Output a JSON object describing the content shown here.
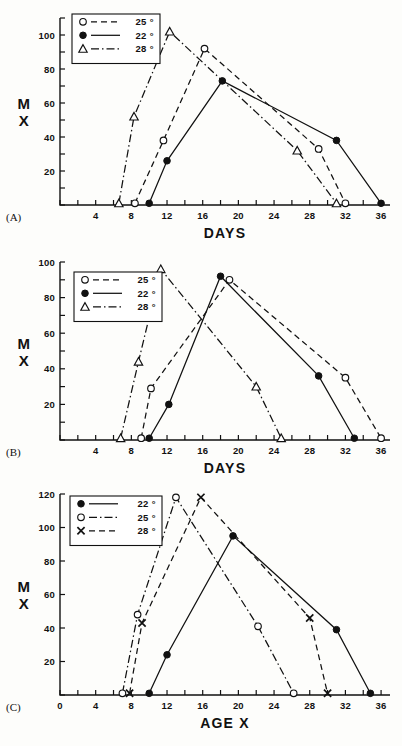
{
  "figure": {
    "label": "Temperature effect on MX versus age",
    "panels": [
      "A",
      "B",
      "C"
    ]
  },
  "chart_data": [
    {
      "type": "line",
      "panel_tag": "(A)",
      "title": "",
      "xlabel": "DAYS",
      "ylabel": "MX",
      "xlim": [
        0,
        37
      ],
      "ylim": [
        0,
        110
      ],
      "xticks": [
        0,
        2,
        4,
        6,
        8,
        10,
        12,
        14,
        16,
        18,
        20,
        22,
        24,
        26,
        28,
        30,
        32,
        34,
        36
      ],
      "xticklabels": [
        "",
        "",
        "4",
        "",
        "8",
        "",
        "12",
        "",
        "16",
        "",
        "20",
        "",
        "24",
        "",
        "28",
        "",
        "32",
        "",
        "36"
      ],
      "yticks": [
        0,
        10,
        20,
        30,
        40,
        50,
        60,
        70,
        80,
        90,
        100,
        110
      ],
      "yticklabels": [
        "",
        "",
        "20",
        "",
        "40",
        "",
        "60",
        "",
        "80",
        "",
        "100",
        ""
      ],
      "grid": false,
      "legend_position": "top-left",
      "series": [
        {
          "name": "25 °",
          "marker": "open-circle",
          "line": "dashed",
          "x": [
            8.4,
            11.6,
            16.2,
            29.0,
            32.0
          ],
          "y": [
            1,
            38,
            92,
            33,
            1
          ]
        },
        {
          "name": "22 °",
          "marker": "filled-circle",
          "line": "solid",
          "x": [
            10.0,
            12.0,
            18.2,
            31.0,
            36.0
          ],
          "y": [
            1,
            26,
            73,
            38,
            1
          ]
        },
        {
          "name": "28 °",
          "marker": "open-triangle",
          "line": "dash-dot",
          "x": [
            6.6,
            8.3,
            12.3,
            26.6,
            31.0
          ],
          "y": [
            1,
            52,
            102,
            32,
            1
          ]
        }
      ]
    },
    {
      "type": "line",
      "panel_tag": "(B)",
      "title": "",
      "xlabel": "DAYS",
      "ylabel": "MX",
      "xlim": [
        0,
        37
      ],
      "ylim": [
        0,
        100
      ],
      "xticks": [
        0,
        2,
        4,
        6,
        8,
        10,
        12,
        14,
        16,
        18,
        20,
        22,
        24,
        26,
        28,
        30,
        32,
        34,
        36
      ],
      "xticklabels": [
        "",
        "",
        "4",
        "",
        "8",
        "",
        "12",
        "",
        "16",
        "",
        "20",
        "",
        "24",
        "",
        "28",
        "",
        "32",
        "",
        "36"
      ],
      "yticks": [
        0,
        10,
        20,
        30,
        40,
        50,
        60,
        70,
        80,
        90,
        100
      ],
      "yticklabels": [
        "",
        "",
        "20",
        "",
        "40",
        "",
        "60",
        "",
        "80",
        "",
        "100"
      ],
      "grid": false,
      "legend_position": "top-left",
      "series": [
        {
          "name": "25 °",
          "marker": "open-circle",
          "line": "dashed",
          "x": [
            9.1,
            10.2,
            19.0,
            32.0,
            36.0
          ],
          "y": [
            1,
            29,
            90,
            35,
            1
          ]
        },
        {
          "name": "22 °",
          "marker": "filled-circle",
          "line": "solid",
          "x": [
            10.0,
            12.2,
            18.0,
            29.0,
            33.0
          ],
          "y": [
            1,
            20,
            92,
            36,
            1
          ]
        },
        {
          "name": "28 °",
          "marker": "open-triangle",
          "line": "dash-dot",
          "x": [
            6.8,
            8.8,
            11.3,
            22.0,
            24.8
          ],
          "y": [
            1,
            44,
            96,
            30,
            1
          ]
        }
      ]
    },
    {
      "type": "line",
      "panel_tag": "(C)",
      "title": "",
      "xlabel": "AGE  X",
      "ylabel": "MX",
      "xlim": [
        0,
        37
      ],
      "ylim": [
        0,
        120
      ],
      "xticks": [
        0,
        2,
        4,
        6,
        8,
        10,
        12,
        14,
        16,
        18,
        20,
        22,
        24,
        26,
        28,
        30,
        32,
        34,
        36
      ],
      "xticklabels": [
        "0",
        "",
        "4",
        "",
        "8",
        "",
        "12",
        "",
        "16",
        "",
        "20",
        "",
        "24",
        "",
        "28",
        "",
        "32",
        "",
        "36"
      ],
      "yticks": [
        0,
        20,
        40,
        60,
        80,
        100,
        120
      ],
      "yticklabels": [
        "",
        "20",
        "40",
        "60",
        "80",
        "100",
        "120"
      ],
      "grid": false,
      "legend_position": "top-left",
      "series": [
        {
          "name": "22 °",
          "marker": "filled-circle",
          "line": "solid",
          "x": [
            10.0,
            12.0,
            19.4,
            31.0,
            34.8
          ],
          "y": [
            1,
            24,
            95,
            39,
            1
          ]
        },
        {
          "name": "25 °",
          "marker": "open-circle",
          "line": "dash-dot",
          "x": [
            7.0,
            8.7,
            13.0,
            22.2,
            26.2
          ],
          "y": [
            1,
            48,
            118,
            41,
            1
          ]
        },
        {
          "name": "28 °",
          "marker": "cross-x",
          "line": "dashed",
          "x": [
            7.8,
            9.2,
            15.8,
            28.0,
            30.0
          ],
          "y": [
            1,
            43,
            118,
            46,
            1
          ]
        }
      ]
    }
  ]
}
